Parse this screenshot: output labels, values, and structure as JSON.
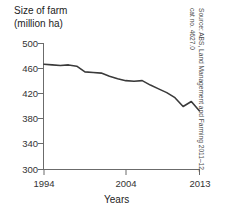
{
  "chart_data": {
    "type": "line",
    "title": "Size of farm (million ha)",
    "title_line1": "Size of farm",
    "title_line2": "(million ha)",
    "xlabel": "Years",
    "ylabel": "Size of farm (million ha)",
    "ylim": [
      300,
      500
    ],
    "xlim": [
      1994,
      2013
    ],
    "grid": false,
    "legend": null,
    "yticks": [
      500,
      460,
      420,
      380,
      340,
      300
    ],
    "ytick_labels": [
      "500",
      "460",
      "420",
      "380",
      "340",
      "300"
    ],
    "xticks": [
      1994,
      2004,
      2013
    ],
    "xtick_labels": [
      "1994",
      "2004",
      "2013"
    ],
    "x": [
      1994,
      1995,
      1996,
      1997,
      1998,
      1999,
      2000,
      2001,
      2002,
      2003,
      2004,
      2005,
      2006,
      2007,
      2008,
      2009,
      2010,
      2011,
      2012,
      2013
    ],
    "values": [
      467,
      466,
      465,
      466,
      464,
      455,
      454,
      453,
      448,
      444,
      441,
      440,
      441,
      434,
      428,
      422,
      414,
      400,
      408,
      393
    ],
    "series": [
      {
        "name": "Size of farm",
        "values": [
          467,
          466,
          465,
          466,
          464,
          455,
          454,
          453,
          448,
          444,
          441,
          440,
          441,
          434,
          428,
          422,
          414,
          400,
          408,
          393
        ]
      }
    ],
    "line_color": "#3a3a3a",
    "annotations": []
  },
  "source": {
    "line1": "Source: ABS, Land Management and Farming 2011–12,",
    "line2": "cat no. 4627.0",
    "text": "Source: ABS, Land Management and Farming 2011–12, cat no. 4627.0"
  }
}
